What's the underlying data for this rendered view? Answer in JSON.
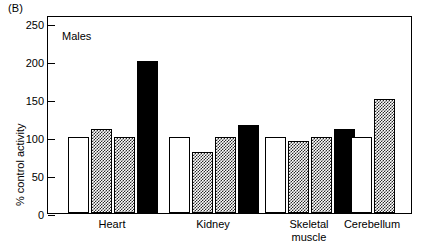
{
  "figure": {
    "panel_letter": "(B)",
    "annotation": "Males"
  },
  "axes": {
    "ylabel": "% control activity",
    "yticks": [
      "0",
      "50",
      "100",
      "150",
      "200",
      "250"
    ]
  },
  "chart_data": {
    "type": "bar",
    "title": "(B)",
    "subtitle": "Males",
    "xlabel": "",
    "ylabel": "% control activity",
    "ylim": [
      0,
      260
    ],
    "ytick_values": [
      0,
      50,
      100,
      150,
      200,
      250
    ],
    "grid": false,
    "legend": null,
    "categories": [
      "Heart",
      "Kidney",
      "Skeletal\nmuscle",
      "Cerebellum"
    ],
    "series": [
      {
        "name": "control",
        "fill": "white",
        "values": [
          100,
          100,
          100,
          100
        ]
      },
      {
        "name": "dose-1",
        "fill": "hatch",
        "values": [
          110,
          80,
          95,
          150
        ]
      },
      {
        "name": "dose-2",
        "fill": "hatch",
        "values": [
          100,
          100,
          100,
          null
        ]
      },
      {
        "name": "dose-3",
        "fill": "black",
        "values": [
          200,
          115,
          110,
          null
        ]
      }
    ],
    "bars": [
      {
        "group": "Heart",
        "index": 0,
        "fill": "white",
        "value": 100
      },
      {
        "group": "Heart",
        "index": 1,
        "fill": "hatch",
        "value": 110
      },
      {
        "group": "Heart",
        "index": 2,
        "fill": "hatch",
        "value": 100
      },
      {
        "group": "Heart",
        "index": 3,
        "fill": "black",
        "value": 200
      },
      {
        "group": "Kidney",
        "index": 0,
        "fill": "white",
        "value": 100
      },
      {
        "group": "Kidney",
        "index": 1,
        "fill": "hatch",
        "value": 80
      },
      {
        "group": "Kidney",
        "index": 2,
        "fill": "hatch",
        "value": 100
      },
      {
        "group": "Kidney",
        "index": 3,
        "fill": "black",
        "value": 115
      },
      {
        "group": "Skeletal muscle",
        "index": 0,
        "fill": "white",
        "value": 100
      },
      {
        "group": "Skeletal muscle",
        "index": 1,
        "fill": "hatch",
        "value": 95
      },
      {
        "group": "Skeletal muscle",
        "index": 2,
        "fill": "hatch",
        "value": 100
      },
      {
        "group": "Skeletal muscle",
        "index": 3,
        "fill": "black",
        "value": 110
      },
      {
        "group": "Cerebellum",
        "index": 0,
        "fill": "white",
        "value": 100
      },
      {
        "group": "Cerebellum",
        "index": 1,
        "fill": "hatch",
        "value": 150
      }
    ]
  },
  "xlabels": [
    {
      "text": "Heart"
    },
    {
      "text": "Kidney"
    },
    {
      "text": "Skeletal\nmuscle"
    },
    {
      "text": "Cerebellum"
    }
  ],
  "colors": {
    "axis": "#000000",
    "bar_white": "#ffffff",
    "bar_black": "#000000",
    "bar_hatch": "#2b2b2b",
    "background": "#ffffff"
  }
}
